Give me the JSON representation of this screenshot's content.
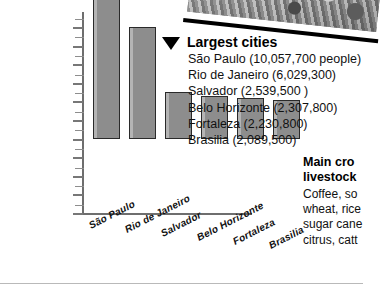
{
  "chart_data": {
    "type": "bar",
    "title": "",
    "xlabel": "",
    "ylabel": "",
    "categories": [
      "São Paulo",
      "Rio de Janeiro",
      "Salvador",
      "Belo Horizonte",
      "Fortaleza",
      "Brasilia"
    ],
    "values": [
      10057700,
      6029300,
      2539500,
      2307800,
      2230800,
      2089500
    ],
    "ylim": [
      0,
      10000000
    ],
    "ytick_labels": [
      "10,000,000",
      "9,000,000",
      "8,000,000",
      "7,000,000",
      "6,000,000",
      "5,000,000",
      "4,000,000",
      "3,000,000",
      "2,000,000",
      "1,000,000",
      "0"
    ],
    "ytick_values": [
      10000000,
      9000000,
      8000000,
      7000000,
      6000000,
      5000000,
      4000000,
      3000000,
      2000000,
      1000000,
      0
    ],
    "grid": false,
    "legend_position": "none",
    "bar_color": "#8f8f8f",
    "bar_edge_color": "#2a2a2a"
  },
  "legend": {
    "marker": "triangle-down-icon",
    "title": "Largest cities",
    "items": [
      "São Paulo (10,057,700 people)",
      "Rio de Janeiro (6,029,300)",
      "Salvador (2,539,500 )",
      "Belo Horizonte (2,307,800)",
      "Fortaleza (2,230,800)",
      "Brasilia (2,089,500)"
    ]
  },
  "sidebar": {
    "heading_line1": "Main cro",
    "heading_line2": "livestock",
    "body_lines": [
      "Coffee, so",
      "wheat, rice",
      "sugar cane",
      "citrus, catt"
    ]
  },
  "photo": {
    "alt": "aerial-city-photo"
  }
}
